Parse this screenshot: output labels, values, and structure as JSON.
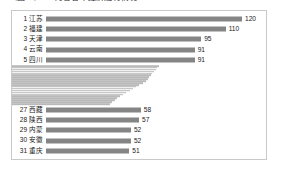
{
  "title": "（图二）1-2月各省市经济运行情况",
  "chart_data": {
    "type": "bar",
    "orientation": "horizontal",
    "title": "（图二）1-2月各省市经济运行情况",
    "xlabel": "",
    "ylabel": "",
    "grid": false,
    "legend": null,
    "xlim": [
      0,
      120
    ],
    "note": "31 ranked rows; ranks 1-5 and 27-31 are shown at full height with rank labels and value labels, ranks 6-26 are rendered as compressed unlabeled bars.",
    "categories": [
      "1 江苏",
      "2 福建",
      "3 天津",
      "4 云南",
      "5 四川",
      "6",
      "7",
      "8",
      "9",
      "10",
      "11",
      "12",
      "13",
      "14",
      "15",
      "16",
      "17",
      "18",
      "19",
      "20",
      "21",
      "22",
      "23",
      "24",
      "25",
      "26",
      "27 西藏",
      "28 陕西",
      "29 内蒙",
      "30 安徽",
      "31 重庆"
    ],
    "values": [
      120,
      110,
      95,
      91,
      91,
      90,
      89,
      88,
      87,
      86,
      85,
      84,
      83,
      82,
      80,
      78,
      76,
      74,
      72,
      70,
      68,
      66,
      64,
      63,
      61,
      60,
      58,
      57,
      52,
      52,
      51
    ],
    "labeled_rows": [
      {
        "rank": 1,
        "name": "江苏",
        "label": "1 江苏",
        "value": 120
      },
      {
        "rank": 2,
        "name": "福建",
        "label": "2 福建",
        "value": 110
      },
      {
        "rank": 3,
        "name": "天津",
        "label": "3 天津",
        "value": 95
      },
      {
        "rank": 4,
        "name": "云南",
        "label": "4 云南",
        "value": 91
      },
      {
        "rank": 5,
        "name": "四川",
        "label": "5 四川",
        "value": 91
      },
      {
        "rank": 27,
        "name": "西藏",
        "label": "27 西藏",
        "value": 58
      },
      {
        "rank": 28,
        "name": "陕西",
        "label": "28 陕西",
        "value": 57
      },
      {
        "rank": 29,
        "name": "内蒙",
        "label": "29 内蒙",
        "value": 52
      },
      {
        "rank": 30,
        "name": "安徽",
        "label": "30 安徽",
        "value": 52
      },
      {
        "rank": 31,
        "name": "重庆",
        "label": "31 重庆",
        "value": 51
      }
    ],
    "colors": {
      "bar_major": "#858585",
      "bar_minor": "#b9b9b9",
      "text": "#1a1a1a",
      "frame": "#c9c9c9",
      "background": "#ffffff"
    }
  }
}
